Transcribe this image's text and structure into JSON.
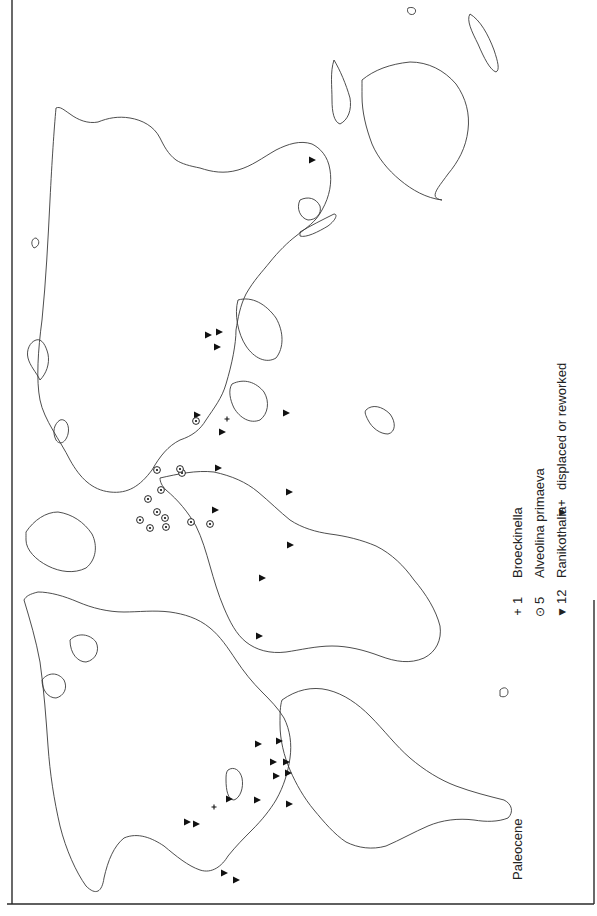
{
  "map": {
    "title": "Paleocene",
    "orientation": "rotated 90° counter-clockwise",
    "colors": {
      "coastline": "#3a3a3a",
      "marker": "#111111",
      "frame": "#2a2a2a",
      "background": "#ffffff"
    }
  },
  "legend": {
    "items": [
      {
        "symbol": "+",
        "symbol_name": "plus-icon",
        "count": "1",
        "label": "Broeckinella"
      },
      {
        "symbol": "⊙",
        "symbol_name": "circled-dot-icon",
        "count": "5",
        "label": "Alveolina primaeva"
      },
      {
        "symbol": "▼",
        "symbol_name": "triangle-icon",
        "count": "12",
        "label": "Ranikothalia"
      }
    ],
    "displaced": {
      "symbol": "▼+",
      "label": "displaced or reworked"
    }
  },
  "markers": {
    "ranikothalia": [
      [
        208,
        335
      ],
      [
        219,
        332
      ],
      [
        217,
        347
      ],
      [
        312,
        160
      ],
      [
        197,
        415
      ],
      [
        222,
        432
      ],
      [
        286,
        413
      ],
      [
        215,
        510
      ],
      [
        262,
        578
      ],
      [
        289,
        492
      ],
      [
        290,
        545
      ],
      [
        259,
        636
      ],
      [
        279,
        741
      ],
      [
        258,
        744
      ],
      [
        273,
        762
      ],
      [
        276,
        776
      ],
      [
        286,
        762
      ],
      [
        288,
        773
      ],
      [
        289,
        804
      ],
      [
        229,
        799
      ],
      [
        187,
        822
      ],
      [
        196,
        824
      ],
      [
        224,
        873
      ],
      [
        236,
        880
      ],
      [
        257,
        800
      ],
      [
        218,
        468
      ]
    ],
    "alveolina": [
      [
        196,
        421
      ],
      [
        182,
        473
      ],
      [
        148,
        499
      ],
      [
        210,
        524
      ],
      [
        157,
        512
      ],
      [
        165,
        518
      ],
      [
        140,
        520
      ],
      [
        150,
        528
      ],
      [
        157,
        470
      ],
      [
        166,
        527
      ],
      [
        161,
        490
      ],
      [
        180,
        469
      ],
      [
        191,
        522
      ]
    ],
    "broeckinella": [
      [
        227,
        419
      ],
      [
        214,
        807
      ]
    ]
  }
}
